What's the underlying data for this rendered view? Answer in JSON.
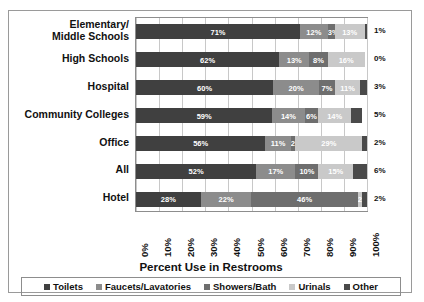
{
  "chart_data": {
    "type": "bar",
    "title": "",
    "xlabel": "Percent Use in Restrooms",
    "ylabel": "",
    "orientation": "horizontal",
    "stacked": true,
    "grid": true,
    "legend_position": "bottom",
    "xlim": [
      0,
      100
    ],
    "categories": [
      "Elementary/ Middle Schools",
      "High Schools",
      "Hospital",
      "Community Colleges",
      "Office",
      "All",
      "Hotel"
    ],
    "tick_labels": [
      "0%",
      "10%",
      "20%",
      "30%",
      "40%",
      "50%",
      "60%",
      "70%",
      "80%",
      "90%",
      "100%"
    ],
    "series": [
      {
        "name": "Toilets",
        "color": "#404040",
        "values": [
          71,
          62,
          60,
          59,
          56,
          52,
          28
        ],
        "labels": [
          "71%",
          "62%",
          "60%",
          "59%",
          "56%",
          "52%",
          "28%"
        ]
      },
      {
        "name": "Faucets/Lavatories",
        "color": "#8c8c8c",
        "values": [
          12,
          13,
          20,
          14,
          11,
          17,
          22
        ],
        "labels": [
          "12%",
          "13%",
          "20%",
          "14%",
          "11%",
          "17%",
          "22%"
        ]
      },
      {
        "name": "Showers/Bath",
        "color": "#6e6e6e",
        "values": [
          3,
          8,
          7,
          6,
          2,
          10,
          46
        ],
        "labels": [
          "3%",
          "8%",
          "7%",
          "6%",
          "2%",
          "10%",
          "46%"
        ]
      },
      {
        "name": "Urinals",
        "color": "#c9c9c9",
        "values": [
          13,
          16,
          11,
          14,
          29,
          15,
          2
        ],
        "labels": [
          "13%",
          "16%",
          "11%",
          "14%",
          "29%",
          "15%",
          "2%"
        ]
      },
      {
        "name": "Other",
        "color": "#4a4a4a",
        "values": [
          1,
          0,
          3,
          5,
          2,
          6,
          2
        ],
        "labels": [
          "1%",
          "0%",
          "3%",
          "5%",
          "2%",
          "6%",
          "2%"
        ]
      }
    ]
  }
}
